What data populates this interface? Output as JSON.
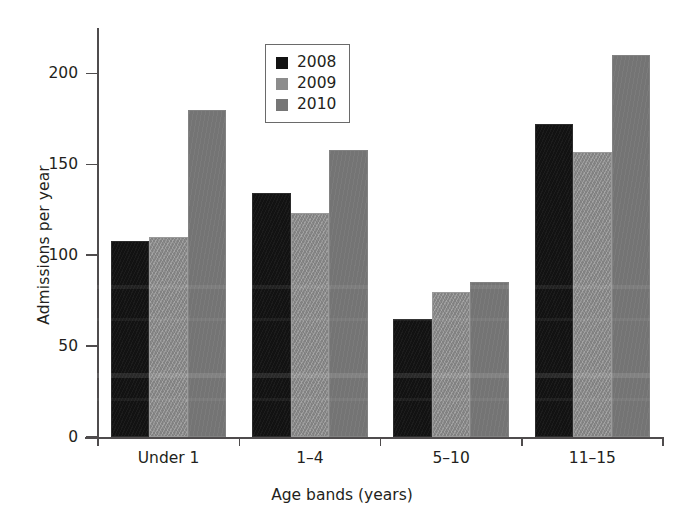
{
  "chart_data": {
    "type": "bar",
    "title": "",
    "xlabel": "Age bands (years)",
    "ylabel": "Admissions per year",
    "categories": [
      "Under 1",
      "1–4",
      "5–10",
      "11–15"
    ],
    "series": [
      {
        "name": "2008",
        "color": "#121212",
        "values": [
          108,
          134,
          65,
          172
        ]
      },
      {
        "name": "2009",
        "color": "#8c8c8c",
        "values": [
          110,
          123,
          80,
          157
        ]
      },
      {
        "name": "2010",
        "color": "#767676",
        "values": [
          180,
          158,
          85,
          210
        ]
      }
    ],
    "ylim": [
      0,
      220
    ],
    "yticks": [
      0,
      50,
      100,
      150,
      200
    ],
    "ytick_labels": [
      "0",
      "50",
      "100",
      "150",
      "200"
    ],
    "grid": false,
    "legend_position": "top-center"
  },
  "axes": {
    "y_title": "Admissions per year",
    "x_title": "Age bands (years)"
  },
  "legend": {
    "entries": [
      {
        "label": "2008",
        "swatch": "#121212"
      },
      {
        "label": "2009",
        "swatch": "#8c8c8c"
      },
      {
        "label": "2010",
        "swatch": "#767676"
      }
    ]
  }
}
